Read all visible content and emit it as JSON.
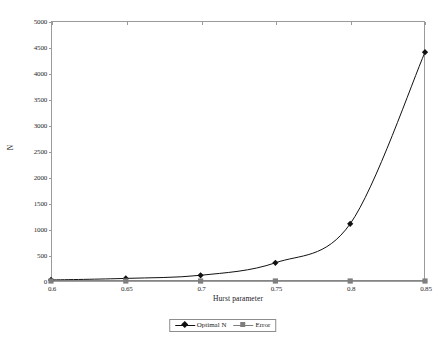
{
  "chart_data": {
    "type": "line",
    "title": "",
    "xlabel": "Hurst parameter",
    "ylabel": "N",
    "x": [
      0.6,
      0.65,
      0.7,
      0.75,
      0.8,
      0.85
    ],
    "xtick_labels": [
      "0.6",
      "0.65",
      "0.7",
      "0.75",
      "0.8",
      "0.85"
    ],
    "xlim": [
      0.6,
      0.85
    ],
    "ytick_labels": [
      "0",
      "500",
      "1000",
      "1500",
      "2000",
      "2500",
      "3000",
      "3500",
      "4000",
      "4500",
      "5000"
    ],
    "ytick_values": [
      0,
      500,
      1000,
      1500,
      2000,
      2500,
      3000,
      3500,
      4000,
      4500,
      5000
    ],
    "ylim": [
      0,
      5000
    ],
    "grid": false,
    "legend_position": "bottom-center",
    "series": [
      {
        "name": "Optimal N",
        "values": [
          20,
          50,
          110,
          350,
          1100,
          4400
        ],
        "color": "#111111",
        "marker": "diamond"
      },
      {
        "name": "Error",
        "values": [
          0,
          0,
          0,
          0,
          0,
          0
        ],
        "color": "#7e7e7e",
        "marker": "square"
      }
    ]
  },
  "legend": {
    "entries": [
      {
        "label": "Optimal N"
      },
      {
        "label": "Error"
      }
    ]
  },
  "colors": {
    "optimal_n": "#111111",
    "error": "#7e7e7e",
    "axis": "#9a9a9a",
    "background": "#ffffff"
  }
}
